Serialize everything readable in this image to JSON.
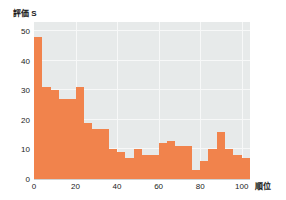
{
  "chart_data": {
    "type": "bar",
    "title": "",
    "ylabel": "評価 S",
    "xlabel": "順位",
    "xlim": [
      0,
      104
    ],
    "ylim": [
      0,
      53
    ],
    "grid": true,
    "legend": null,
    "bar_color": "#f1834c",
    "plot_background": "#e7eaea",
    "grid_color": "#f7f8f8",
    "yticks": [
      0,
      10,
      20,
      30,
      40,
      50
    ],
    "ytick_labels": [
      "0",
      "10",
      "20",
      "30",
      "40",
      "50"
    ],
    "xticks": [
      0,
      20,
      40,
      60,
      80,
      100
    ],
    "xtick_labels": [
      "0",
      "20",
      "40",
      "60",
      "80",
      "100"
    ],
    "bin_width": 4,
    "bin_starts": [
      0,
      4,
      8,
      12,
      16,
      20,
      24,
      28,
      32,
      36,
      40,
      44,
      48,
      52,
      56,
      60,
      64,
      68,
      72,
      76,
      80,
      84,
      88,
      92,
      96,
      100
    ],
    "values": [
      48,
      31,
      30,
      27,
      27,
      31,
      19,
      17,
      17,
      10,
      9,
      7,
      10,
      8,
      8,
      12,
      13,
      11,
      11,
      3,
      6,
      10,
      16,
      10,
      8,
      7
    ]
  }
}
